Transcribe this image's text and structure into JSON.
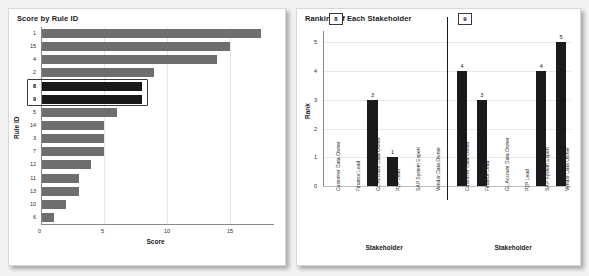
{
  "background_color": "#f2f2f2",
  "panel_color": "#ffffff",
  "bar_color": "#6e6e6e",
  "highlight_color": "#191919",
  "left_panel": {
    "title": "Score by Rule ID"
  },
  "right_panel": {
    "title": "Ranking of Each Stakeholder"
  },
  "chart_data": [
    {
      "type": "bar",
      "orientation": "horizontal",
      "title": "Score by Rule ID",
      "xlabel": "Score",
      "ylabel": "Rule ID",
      "xlim": [
        0,
        18.5
      ],
      "xticks": [
        0,
        5,
        10,
        15
      ],
      "grid": "vertical",
      "highlighted_categories": [
        "8",
        "9"
      ],
      "categories": [
        "1",
        "15",
        "4",
        "2",
        "8",
        "9",
        "5",
        "14",
        "3",
        "7",
        "12",
        "11",
        "13",
        "10",
        "6"
      ],
      "values": [
        17.5,
        15.0,
        14.0,
        9.0,
        8.0,
        8.0,
        6.0,
        5.0,
        5.0,
        5.0,
        4.0,
        3.0,
        3.0,
        2.0,
        1.0
      ]
    },
    {
      "type": "bar",
      "orientation": "vertical",
      "title": "Ranking of Each Stakeholder",
      "xlabel": "Stakeholder",
      "ylabel": "Rank",
      "ylim": [
        0,
        5.4
      ],
      "yticks": [
        0,
        1,
        2,
        3,
        4,
        5
      ],
      "grid": "horizontal",
      "categories": [
        "Customer Data Owner",
        "Finance Lead",
        "GL Account Data Owner",
        "P2P Lead",
        "SAP System Expert",
        "Vendor Data Owner"
      ],
      "groups": [
        {
          "label": "8",
          "values": [
            0,
            0,
            3,
            1,
            0,
            0
          ]
        },
        {
          "label": "9",
          "values": [
            4,
            3,
            0,
            0,
            4,
            5
          ]
        }
      ]
    }
  ]
}
